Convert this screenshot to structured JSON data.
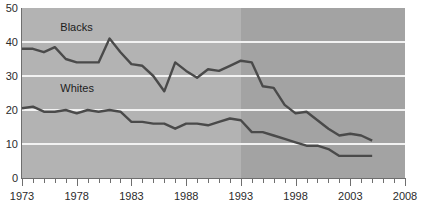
{
  "chart_data": {
    "type": "line",
    "title": "",
    "xlabel": "",
    "ylabel": "",
    "xlim": [
      1973,
      2008
    ],
    "ylim": [
      0,
      50
    ],
    "grid": true,
    "gridlines_y": [
      10,
      20,
      30,
      40
    ],
    "x_ticks_major": [
      1973,
      1978,
      1983,
      1988,
      1993,
      1998,
      2003,
      2008
    ],
    "x_tick_labels": [
      "1973",
      "1978",
      "1983",
      "1988",
      "1993",
      "1998",
      "2003",
      "2008"
    ],
    "x_tick_interval_minor": 1,
    "y_ticks": [
      0,
      10,
      20,
      30,
      40,
      50
    ],
    "y_tick_labels": [
      "0",
      "10",
      "20",
      "30",
      "40",
      "50"
    ],
    "legend_position": "inline-annotation",
    "shaded_region": {
      "from": 1993,
      "to": 2008,
      "note": "darker background band"
    },
    "x": [
      1973,
      1974,
      1975,
      1976,
      1977,
      1978,
      1979,
      1980,
      1981,
      1982,
      1983,
      1984,
      1985,
      1986,
      1987,
      1988,
      1989,
      1990,
      1991,
      1992,
      1993,
      1994,
      1995,
      1996,
      1997,
      1998,
      1999,
      2000,
      2001,
      2002,
      2003,
      2004,
      2005
    ],
    "series": [
      {
        "name": "Blacks",
        "label": "Blacks",
        "color": "#4a4a4a",
        "values": [
          38.0,
          38.0,
          37.0,
          38.5,
          35.0,
          34.0,
          34.0,
          34.0,
          41.0,
          37.0,
          33.5,
          33.0,
          30.0,
          25.5,
          34.0,
          31.5,
          29.5,
          32.0,
          31.5,
          33.0,
          34.5,
          34.0,
          27.0,
          26.5,
          21.5,
          19.0,
          19.5,
          17.0,
          14.5,
          12.5,
          13.0,
          12.5,
          11.0
        ]
      },
      {
        "name": "Whites",
        "label": "Whites",
        "color": "#4a4a4a",
        "values": [
          20.5,
          21.0,
          19.5,
          19.5,
          20.0,
          19.0,
          20.0,
          19.5,
          20.0,
          19.5,
          16.5,
          16.5,
          16.0,
          16.0,
          14.5,
          16.0,
          16.0,
          15.5,
          16.5,
          17.5,
          17.0,
          13.5,
          13.5,
          12.5,
          11.5,
          10.5,
          9.5,
          9.5,
          8.5,
          6.5,
          6.5,
          6.5,
          6.5
        ]
      }
    ],
    "annotations": [
      {
        "text": "Blacks",
        "x": 1976.5,
        "y": 44.5
      },
      {
        "text": "Whites",
        "x": 1976.5,
        "y": 26.5
      }
    ]
  },
  "colors": {
    "plot_background_early": "#b3b3b3",
    "plot_background_late": "#a3a3a3",
    "gridline": "#f2f2f2",
    "line": "#4a4a4a",
    "axis": "#6e6e6e",
    "text": "#2b2b2b",
    "page_background": "#ffffff"
  }
}
